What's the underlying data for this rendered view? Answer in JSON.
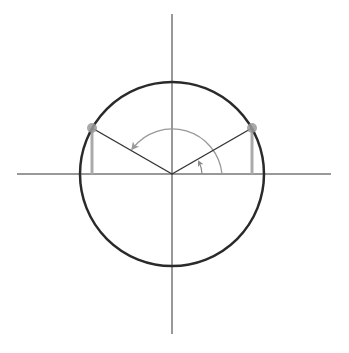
{
  "diagram": {
    "type": "unit-circle",
    "center": [
      172,
      174
    ],
    "radius": 92,
    "axes": {
      "horizontal": {
        "x1": 17,
        "x2": 331,
        "y": 174
      },
      "vertical": {
        "x": 172,
        "y1": 14,
        "y2": 334
      }
    },
    "angle_degrees": 30,
    "supplementary_angle_degrees": 150,
    "points": [
      {
        "name": "P1",
        "position": "first-quadrant",
        "x": 252,
        "y": 128
      },
      {
        "name": "P2",
        "position": "second-quadrant",
        "x": 92,
        "y": 128
      }
    ],
    "colors": {
      "circle": "#2a2a2a",
      "axes": "#333333",
      "radius": "#333333",
      "projection": "#aaaaaa",
      "arc": "#999999",
      "point": "#999999"
    }
  }
}
